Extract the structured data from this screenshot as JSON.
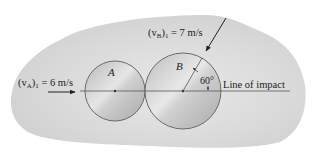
{
  "diagram": {
    "type": "collision-free-body",
    "background_blob_color": "#d4d4d4",
    "disk_fill_color": "#c8c8c8",
    "disk_edge_color": "#6a6a6a",
    "line_color": "#555555",
    "disks": [
      {
        "id": "A",
        "label": "A",
        "cx": 115,
        "cy": 91,
        "r": 30
      },
      {
        "id": "B",
        "label": "B",
        "cx": 183,
        "cy": 91,
        "r": 38
      }
    ],
    "velocities": {
      "A": {
        "label_prefix": "(v",
        "subscript": "A",
        "label_suffix": ")",
        "index": "1",
        "value_text": " = 6 m/s",
        "magnitude": 6,
        "unit": "m/s"
      },
      "B": {
        "label_prefix": "(v",
        "subscript": "B",
        "label_suffix": ")",
        "index": "1",
        "value_text": " = 7 m/s",
        "magnitude": 7,
        "unit": "m/s"
      }
    },
    "angle": {
      "label": "60°",
      "value_deg": 60
    },
    "line_of_impact": {
      "label": "Line of impact",
      "y": 91
    }
  }
}
